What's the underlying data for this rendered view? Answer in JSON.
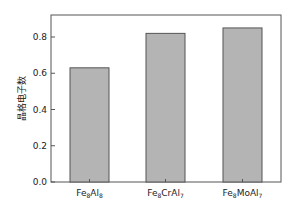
{
  "chart_data": {
    "type": "bar",
    "title": "",
    "xlabel": "",
    "ylabel": "晶格电子数",
    "categories": [
      {
        "base": "Fe",
        "sub1": "8",
        "mid": "Al",
        "sub2": "8"
      },
      {
        "base": "Fe",
        "sub1": "8",
        "mid": "CrAl",
        "sub2": "7"
      },
      {
        "base": "Fe",
        "sub1": "8",
        "mid": "MoAl",
        "sub2": "7"
      }
    ],
    "category_labels": [
      "Fe8Al8",
      "Fe8CrAl7",
      "Fe8MoAl7"
    ],
    "values": [
      0.63,
      0.82,
      0.85
    ],
    "ylim": [
      0,
      0.92
    ],
    "yticks": [
      "0.0",
      "0.2",
      "0.4",
      "0.6",
      "0.8"
    ],
    "grid": false,
    "legend": null,
    "colors": {
      "bar_fill": "#b4b4b4",
      "bar_stroke": "#555555",
      "axis": "#555555"
    }
  }
}
